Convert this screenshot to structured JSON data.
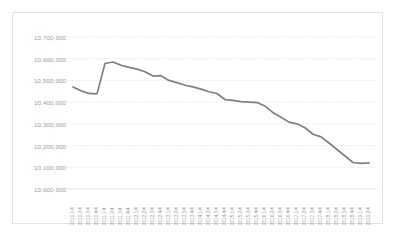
{
  "chart_data": {
    "type": "line",
    "title": "",
    "subtitle": "",
    "xlabel": "",
    "ylabel": "",
    "grid": true,
    "legend": false,
    "legend_position": "none",
    "line_color": "#808080",
    "grid_color": "#d8d8d8",
    "tick_label_color": "#9a9a9a",
    "ylim": [
      10000000,
      10700000
    ],
    "ytick_step": 100000,
    "ytick_labels": [
      "10,700,000",
      "10,600,000",
      "10,500,000",
      "10,400,000",
      "10,300,000",
      "10,200,000",
      "10,100,000",
      "10,000,000"
    ],
    "ytick_values": [
      10700000,
      10600000,
      10500000,
      10400000,
      10300000,
      10200000,
      10100000,
      10000000
    ],
    "categories": [
      "2010.1/4",
      "2010.2/4",
      "2010.3/4",
      "2010.4/4",
      "2011.1/4",
      "2011.2/4",
      "2011.3/4",
      "2011.4/4",
      "2012.1/4",
      "2012.2/4",
      "2012.3/4",
      "2012.4/4",
      "2013.1/4",
      "2013.2/4",
      "2013.3/4",
      "2013.4/4",
      "2014.1/4",
      "2014.2/4",
      "2014.3/4",
      "2014.4/4",
      "2015.1/4",
      "2015.2/4",
      "2015.3/4",
      "2015.4/4",
      "2016.1/4",
      "2016.2/4",
      "2016.3/4",
      "2016.4/4",
      "2017.1/4",
      "2017.2/4",
      "2017.3/4",
      "2017.4/4",
      "2018.1/4",
      "2018.2/4",
      "2018.3/4",
      "2018.4/4",
      "2019.1/4",
      "2019.2/4"
    ],
    "series": [
      {
        "name": "Population",
        "values": [
          10470000,
          10452000,
          10440000,
          10438000,
          10578000,
          10585000,
          10570000,
          10560000,
          10552000,
          10540000,
          10520000,
          10522000,
          10500000,
          10490000,
          10478000,
          10470000,
          10460000,
          10448000,
          10440000,
          10412000,
          10408000,
          10402000,
          10400000,
          10398000,
          10382000,
          10352000,
          10330000,
          10308000,
          10300000,
          10282000,
          10252000,
          10240000,
          10212000,
          10182000,
          10152000,
          10122000,
          10118000,
          10120000
        ]
      }
    ]
  }
}
